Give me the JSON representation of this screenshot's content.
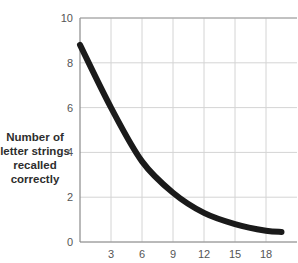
{
  "chart_data": {
    "type": "line",
    "title": "",
    "xlabel": "",
    "ylabel": "Number of letter strings recalled correctly",
    "ylabel_lines": [
      "Number of",
      "letter strings",
      "recalled",
      "correctly"
    ],
    "x_ticks": [
      "3",
      "6",
      "9",
      "12",
      "15",
      "18"
    ],
    "y_ticks": [
      "0",
      "2",
      "4",
      "6",
      "8",
      "10"
    ],
    "xlim": [
      0,
      21
    ],
    "ylim": [
      0,
      10
    ],
    "grid": true,
    "legend": null,
    "series": [
      {
        "name": "recall",
        "color": "#1a1a1a",
        "x": [
          0,
          3,
          6,
          9,
          12,
          15,
          18,
          19.5
        ],
        "y": [
          8.8,
          6.0,
          3.6,
          2.2,
          1.3,
          0.8,
          0.5,
          0.45
        ]
      }
    ]
  }
}
